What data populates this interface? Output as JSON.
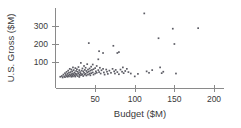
{
  "chart_data": {
    "type": "scatter",
    "title": "",
    "xlabel": "Budget ($M)",
    "ylabel": "U.S. Gross ($M)",
    "xlim": [
      0,
      210
    ],
    "ylim": [
      0,
      390
    ],
    "xticks": [
      50,
      100,
      150,
      200
    ],
    "yticks": [
      100,
      200,
      300
    ],
    "grid": false,
    "legend": null,
    "marker": "square",
    "marker_color": "#5c5c64",
    "axis_color": "#8a8a8a",
    "points": [
      [
        6,
        18
      ],
      [
        8,
        22
      ],
      [
        9,
        14
      ],
      [
        10,
        30
      ],
      [
        11,
        20
      ],
      [
        12,
        38
      ],
      [
        12,
        16
      ],
      [
        13,
        28
      ],
      [
        14,
        45
      ],
      [
        14,
        22
      ],
      [
        15,
        34
      ],
      [
        15,
        18
      ],
      [
        16,
        52
      ],
      [
        16,
        26
      ],
      [
        17,
        40
      ],
      [
        17,
        20
      ],
      [
        18,
        62
      ],
      [
        18,
        30
      ],
      [
        19,
        44
      ],
      [
        19,
        24
      ],
      [
        20,
        58
      ],
      [
        20,
        33
      ],
      [
        20,
        18
      ],
      [
        21,
        48
      ],
      [
        21,
        27
      ],
      [
        22,
        70
      ],
      [
        22,
        36
      ],
      [
        22,
        20
      ],
      [
        23,
        55
      ],
      [
        23,
        30
      ],
      [
        24,
        42
      ],
      [
        24,
        24
      ],
      [
        25,
        66
      ],
      [
        25,
        35
      ],
      [
        25,
        19
      ],
      [
        26,
        50
      ],
      [
        26,
        28
      ],
      [
        27,
        60
      ],
      [
        27,
        33
      ],
      [
        28,
        46
      ],
      [
        28,
        22
      ],
      [
        29,
        72
      ],
      [
        29,
        38
      ],
      [
        30,
        55
      ],
      [
        30,
        30
      ],
      [
        30,
        17
      ],
      [
        31,
        44
      ],
      [
        31,
        26
      ],
      [
        32,
        95
      ],
      [
        32,
        36
      ],
      [
        33,
        52
      ],
      [
        33,
        28
      ],
      [
        34,
        64
      ],
      [
        34,
        32
      ],
      [
        35,
        48
      ],
      [
        35,
        22
      ],
      [
        36,
        78
      ],
      [
        36,
        40
      ],
      [
        37,
        56
      ],
      [
        37,
        30
      ],
      [
        38,
        68
      ],
      [
        38,
        35
      ],
      [
        39,
        50
      ],
      [
        39,
        25
      ],
      [
        40,
        88
      ],
      [
        40,
        42
      ],
      [
        41,
        58
      ],
      [
        41,
        30
      ],
      [
        42,
        205
      ],
      [
        42,
        46
      ],
      [
        43,
        64
      ],
      [
        43,
        34
      ],
      [
        44,
        52
      ],
      [
        44,
        26
      ],
      [
        45,
        74
      ],
      [
        45,
        38
      ],
      [
        46,
        56
      ],
      [
        47,
        86
      ],
      [
        47,
        42
      ],
      [
        48,
        60
      ],
      [
        48,
        30
      ],
      [
        50,
        66
      ],
      [
        50,
        36
      ],
      [
        51,
        48
      ],
      [
        52,
        78
      ],
      [
        52,
        40
      ],
      [
        54,
        115
      ],
      [
        54,
        55
      ],
      [
        55,
        160
      ],
      [
        55,
        44
      ],
      [
        56,
        68
      ],
      [
        57,
        36
      ],
      [
        58,
        54
      ],
      [
        60,
        150
      ],
      [
        60,
        62
      ],
      [
        61,
        42
      ],
      [
        62,
        30
      ],
      [
        64,
        58
      ],
      [
        65,
        46
      ],
      [
        66,
        34
      ],
      [
        68,
        52
      ],
      [
        70,
        40
      ],
      [
        72,
        62
      ],
      [
        73,
        190
      ],
      [
        74,
        48
      ],
      [
        75,
        36
      ],
      [
        76,
        56
      ],
      [
        78,
        150
      ],
      [
        78,
        44
      ],
      [
        80,
        155
      ],
      [
        80,
        32
      ],
      [
        82,
        58
      ],
      [
        84,
        46
      ],
      [
        85,
        70
      ],
      [
        86,
        38
      ],
      [
        88,
        50
      ],
      [
        90,
        62
      ],
      [
        92,
        44
      ],
      [
        95,
        36
      ],
      [
        100,
        20
      ],
      [
        104,
        34
      ],
      [
        112,
        370
      ],
      [
        115,
        48
      ],
      [
        118,
        40
      ],
      [
        122,
        55
      ],
      [
        130,
        232
      ],
      [
        132,
        70
      ],
      [
        134,
        38
      ],
      [
        136,
        46
      ],
      [
        148,
        285
      ],
      [
        150,
        200
      ],
      [
        152,
        36
      ],
      [
        180,
        288
      ]
    ]
  }
}
